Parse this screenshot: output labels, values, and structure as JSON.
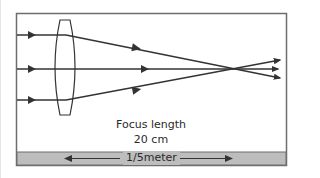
{
  "diagram": {
    "focus_label_line1": "Focus length",
    "focus_label_line2": "20 cm",
    "scale_label": "1/5meter",
    "colors": {
      "frame": "#6e6e6e",
      "rays": "#333333",
      "scale_bar": "#bdbdbd",
      "background": "#ffffff"
    },
    "rays": [
      {
        "name": "top-ray",
        "y": 35
      },
      {
        "name": "middle-ray",
        "y": 69
      },
      {
        "name": "bottom-ray",
        "y": 100
      }
    ]
  }
}
